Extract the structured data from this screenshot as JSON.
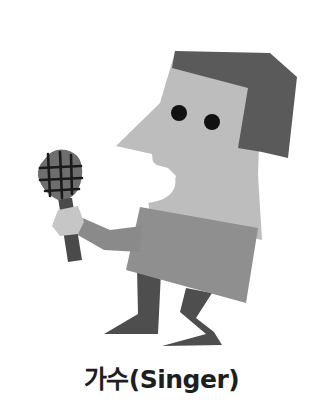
{
  "illustration": {
    "subject": "singer-character",
    "colors": {
      "background": "#ffffff",
      "skin": "#bdbdbd",
      "hair": "#5a5a5a",
      "shirt": "#8f8f8f",
      "legs": "#4e4e4e",
      "eye": "#111111",
      "mic_head": "#6e6e6e",
      "mic_grill": "#1a1a1a",
      "mic_handle": "#4a4a4a",
      "hand": "#c6c6c6",
      "arm": "#8a8a8a"
    }
  },
  "caption": {
    "text": "가수(Singer)"
  }
}
